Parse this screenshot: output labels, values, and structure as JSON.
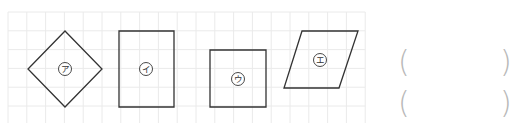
{
  "grid": {
    "origin_x": 8,
    "origin_y": 12,
    "cell": 18.8,
    "cols": 19,
    "rows": 6,
    "line_color": "#eaeaea"
  },
  "shapes": [
    {
      "id": "a",
      "name": "rhombus",
      "label": "ア",
      "stroke": "#333333",
      "points": [
        [
          65,
          31
        ],
        [
          102,
          69
        ],
        [
          65,
          107
        ],
        [
          28,
          69
        ]
      ],
      "label_pos": [
        65,
        69
      ]
    },
    {
      "id": "i",
      "name": "rectangle",
      "label": "イ",
      "stroke": "#333333",
      "points": [
        [
          119,
          31
        ],
        [
          174,
          31
        ],
        [
          174,
          107
        ],
        [
          119,
          107
        ]
      ],
      "label_pos": [
        146,
        69
      ]
    },
    {
      "id": "u",
      "name": "square",
      "label": "ウ",
      "stroke": "#333333",
      "points": [
        [
          210,
          50
        ],
        [
          266,
          50
        ],
        [
          266,
          107
        ],
        [
          210,
          107
        ]
      ],
      "label_pos": [
        238,
        79
      ]
    },
    {
      "id": "e",
      "name": "parallelogram",
      "label": "エ",
      "stroke": "#333333",
      "points": [
        [
          302,
          31
        ],
        [
          358,
          31
        ],
        [
          339,
          88
        ],
        [
          284,
          88
        ]
      ],
      "label_pos": [
        320,
        60
      ]
    }
  ],
  "answers": [
    {
      "open": "(",
      "close": ")",
      "value": ""
    },
    {
      "open": "(",
      "close": ")",
      "value": ""
    }
  ]
}
